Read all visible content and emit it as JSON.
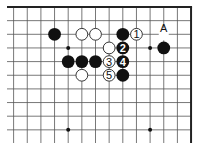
{
  "diagram": {
    "grid": {
      "origin_x": 13.6,
      "origin_y": 7,
      "spacing": 13.65,
      "columns": 14,
      "rows_visible": 10,
      "left_extend_x": 7,
      "bottom_extend_y": 143,
      "top_edge": true,
      "right_edge": true,
      "line_color": "#555555",
      "edge_color": "#222222"
    },
    "star_points": [
      {
        "col": 4,
        "row": 3
      },
      {
        "col": 10,
        "row": 3
      },
      {
        "col": 4,
        "row": 9
      },
      {
        "col": 10,
        "row": 9
      }
    ],
    "stones": [
      {
        "col": 3,
        "row": 2,
        "color": "black",
        "label": ""
      },
      {
        "col": 5,
        "row": 2,
        "color": "white",
        "label": ""
      },
      {
        "col": 6,
        "row": 2,
        "color": "white",
        "label": ""
      },
      {
        "col": 8,
        "row": 2,
        "color": "black",
        "label": ""
      },
      {
        "col": 9,
        "row": 2,
        "color": "white",
        "label": "1"
      },
      {
        "col": 7,
        "row": 3,
        "color": "white",
        "label": ""
      },
      {
        "col": 8,
        "row": 3,
        "color": "black",
        "label": "2"
      },
      {
        "col": 11,
        "row": 3,
        "color": "black",
        "label": ""
      },
      {
        "col": 4,
        "row": 4,
        "color": "black",
        "label": ""
      },
      {
        "col": 5,
        "row": 4,
        "color": "black",
        "label": ""
      },
      {
        "col": 6,
        "row": 4,
        "color": "black",
        "label": ""
      },
      {
        "col": 7,
        "row": 4,
        "color": "white",
        "label": "3"
      },
      {
        "col": 8,
        "row": 4,
        "color": "black",
        "label": "4"
      },
      {
        "col": 5,
        "row": 5,
        "color": "white",
        "label": ""
      },
      {
        "col": 7,
        "row": 5,
        "color": "white",
        "label": "5"
      },
      {
        "col": 8,
        "row": 5,
        "color": "black",
        "label": ""
      }
    ],
    "point_labels": [
      {
        "col": 11,
        "row": 2,
        "text": "A"
      }
    ],
    "colors": {
      "black_stone": "#111111",
      "white_stone": "#ffffff",
      "white_stone_border": "#222222",
      "background": "#ffffff"
    }
  }
}
